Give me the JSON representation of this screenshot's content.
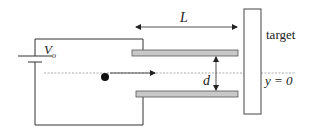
{
  "diagram": {
    "labels": {
      "voltage": "V",
      "voltage_subscript": "o",
      "length": "L",
      "separation": "d",
      "target": "target",
      "axis": "y = 0"
    },
    "colors": {
      "line": "#333333",
      "plate_fill": "#c8c8c8",
      "plate_stroke": "#555555",
      "dashed_axis": "#888888",
      "particle": "#111111"
    }
  }
}
